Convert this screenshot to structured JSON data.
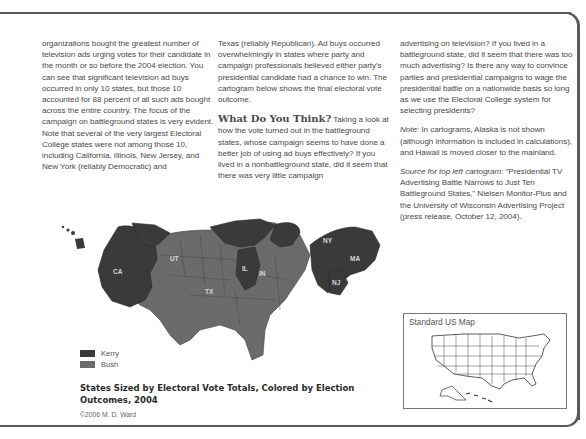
{
  "columns": {
    "col1": {
      "text": "organizations bought the greatest number of television ads urging votes for their candidate in the month or so before the 2004 election. You can see that significant television ad buys occurred in only 10 states, but those 10 accounted for 88 percent of all such ads bought across the entire country. The focus of the campaign on battleground states is very evident. Note that several of the very largest Electoral College states were not among those 10, including California, Illinois, New Jersey, and New York (reliably Democratic) and"
    },
    "col2": {
      "text": "Texas (reliably Republican). Ad buys occurred overwhelmingly in states where party and campaign professionals believed either party's presidential candidate had a chance to win. The cartogram below shows the final electoral vote outcome.",
      "heading": "What Do You Think?",
      "heading_text": "Taking a look at how the vote turned out in the battleground states, whose campaign seems to have done a better job of using ad buys effectively? If you lived in a nonbattleground state, did it seem that there was very little campaign"
    },
    "col3": {
      "text": "advertising on television? If you lived in a battleground state, did it seem that there was too much advertising? Is there any way to convince parties and presidential campaigns to wage the presidential battle on a nationwide basis so long as we use the Electoral College system for selecting presidents?",
      "note_label": "Note:",
      "note_text": "In cartograms, Alaska is not shown (although information is included in calculations), and Hawaii is moved closer to the mainland.",
      "source_label": "Source for top left cartogram:",
      "source_text": "\"Presidential TV Advertising Battle Narrows to Just Ten Battleground States,\" Nielsen Monitor-Plus and the University of Wisconsin Advertising Project (press release, October 12, 2004)."
    }
  },
  "figure": {
    "state_labels": [
      "CA",
      "UT",
      "TX",
      "IL",
      "IN",
      "NY",
      "MA",
      "NJ"
    ],
    "legend": [
      {
        "label": "Kerry",
        "color": "#3a3a3a"
      },
      {
        "label": "Bush",
        "color": "#6a6a6a"
      }
    ],
    "caption": "States Sized by Electoral Vote Totals, Colored by Election Outcomes, 2004",
    "credit": "©2006 M. D. Ward"
  },
  "inset": {
    "title": "Standard US Map"
  },
  "colors": {
    "kerry": "#3a3a3a",
    "bush": "#6a6a6a",
    "frame": "#5a5a5a"
  }
}
